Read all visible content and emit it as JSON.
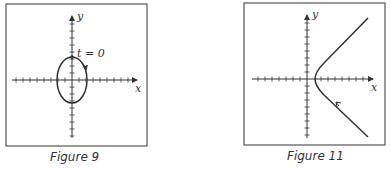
{
  "figures": [
    {
      "caption": "Figure 9",
      "axis_x_label": "x",
      "axis_y_label": "y",
      "annotation": "t = 0",
      "curve": "ellipse",
      "direction": "clockwise"
    },
    {
      "caption": "Figure 11",
      "axis_x_label": "x",
      "axis_y_label": "y",
      "curve": "right branch of hyperbola",
      "direction": "upward along branch"
    }
  ],
  "colors": {
    "ink": "#333333",
    "frame": "#555555",
    "background": "#ffffff"
  }
}
